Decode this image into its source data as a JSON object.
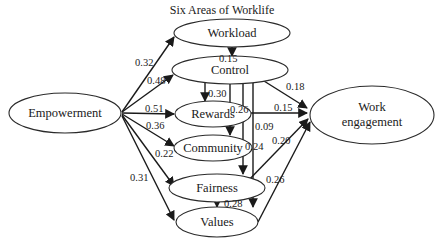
{
  "title": "Six Areas of Worklife",
  "nodes": {
    "empowerment": "Empowerment",
    "workload": "Workload",
    "control": "Control",
    "rewards": "Rewards",
    "community": "Community",
    "fairness": "Fairness",
    "values": "Values",
    "work_engagement_line1": "Work",
    "work_engagement_line2": "engagement"
  },
  "paths": {
    "empowerment_workload": "0.32",
    "empowerment_control": "0.48",
    "empowerment_rewards": "0.51",
    "empowerment_community": "0.36",
    "empowerment_fairness": "0.22",
    "empowerment_values": "0.31",
    "workload_control": "0.15",
    "control_rewards": "0.30",
    "control_community": "0.26",
    "control_fairness": "0.24",
    "control_values": "0.09",
    "control_engagement": "0.18",
    "rewards_engagement": "0.15",
    "fairness_engagement": "0.20",
    "fairness_values": "0.28",
    "values_engagement": "0.26"
  },
  "colors": {
    "stroke": "#1a1a1a",
    "background": "#ffffff"
  }
}
